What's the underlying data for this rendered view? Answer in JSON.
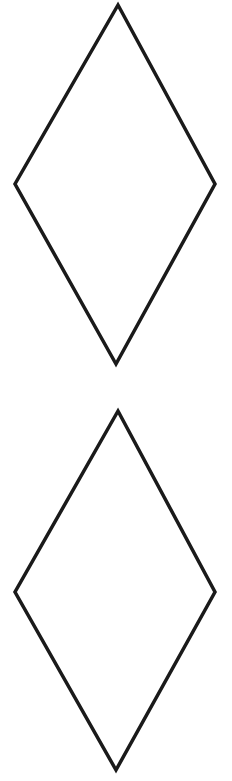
{
  "canvas": {
    "width": 232,
    "height": 781,
    "background_color": "#ffffff"
  },
  "drawing": {
    "description": "Two congruent unfilled diamond (rhombus) outlines stacked vertically",
    "stroke_color": "#1a1a1a",
    "stroke_width": 3.5,
    "diamond_top": {
      "shape": "rhombus-outline",
      "points": "118,5 215,184 116,364 15,184"
    },
    "diamond_bottom": {
      "shape": "rhombus-outline",
      "points": "118,411 215,592 116,770 15,592"
    }
  }
}
